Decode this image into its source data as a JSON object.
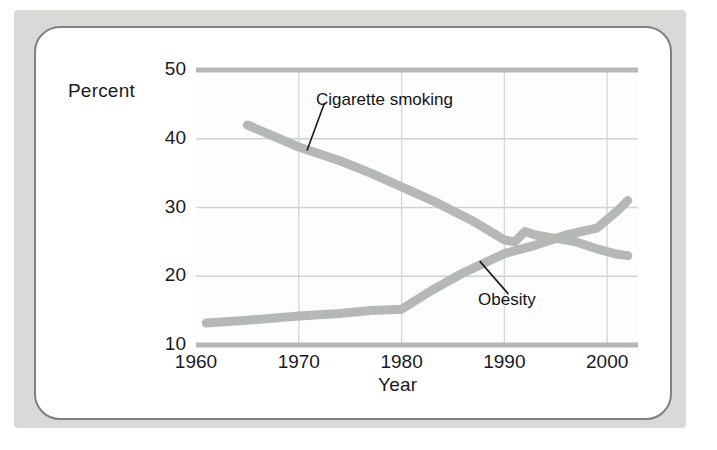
{
  "figure": {
    "ylabel": "Percent",
    "xlabel": "Year"
  },
  "chart_data": {
    "type": "line",
    "title": "",
    "xlabel": "Year",
    "ylabel": "Percent",
    "xlim": [
      1960,
      2003
    ],
    "ylim": [
      10,
      50
    ],
    "xticks": [
      1960,
      1970,
      1980,
      1990,
      2000
    ],
    "yticks": [
      10,
      20,
      30,
      40,
      50
    ],
    "xtick_labels": [
      "1960",
      "1970",
      "1980",
      "1990",
      "2000"
    ],
    "ytick_labels": [
      "10",
      "20",
      "30",
      "40",
      "50"
    ],
    "grid": true,
    "legend_position": "inline-annotations",
    "line_color": "#b5b9b6",
    "line_width_px": 9,
    "series": [
      {
        "name": "Cigarette smoking",
        "annotation": "Cigarette smoking",
        "x": [
          1965,
          1970,
          1974,
          1977,
          1980,
          1983,
          1985,
          1987,
          1990,
          1991,
          1992,
          1993,
          1995,
          1997,
          1999,
          2001,
          2002
        ],
        "values": [
          42.0,
          38.8,
          36.8,
          35.0,
          33.0,
          31.0,
          29.5,
          28.0,
          25.3,
          25.0,
          26.5,
          26.0,
          25.5,
          25.0,
          24.0,
          23.2,
          23.0
        ]
      },
      {
        "name": "Obesity",
        "annotation": "Obesity",
        "x": [
          1961,
          1965,
          1970,
          1974,
          1977,
          1980,
          1983,
          1986,
          1990,
          1993,
          1996,
          1999,
          2001,
          2002
        ],
        "values": [
          13.2,
          13.6,
          14.2,
          14.6,
          15.0,
          15.2,
          18.0,
          20.5,
          23.3,
          24.5,
          26.0,
          27.0,
          29.5,
          31.0
        ]
      }
    ],
    "annotations": [
      {
        "text": "Cigarette smoking",
        "label_x": 1972.5,
        "label_y": 45.2,
        "points_to_x": 1970.8,
        "points_to_y": 38.3
      },
      {
        "text": "Obesity",
        "label_x": 1990.4,
        "label_y": 17.4,
        "points_to_x": 1987.6,
        "points_to_y": 22.2
      }
    ]
  }
}
